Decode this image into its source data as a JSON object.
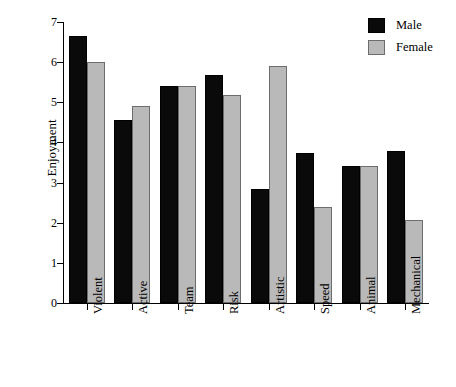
{
  "chart_data": {
    "type": "bar",
    "title": "",
    "subtitle": "",
    "xlabel": "",
    "ylabel": "Enjoyment",
    "categories": [
      "Violent",
      "Active",
      "Team",
      "Risk",
      "Artistic",
      "Speed",
      "Animal",
      "Mechanical"
    ],
    "series": [
      {
        "name": "Male",
        "color": "#0a0a0a",
        "values": [
          6.65,
          4.55,
          5.4,
          5.67,
          2.85,
          3.73,
          3.42,
          3.78
        ]
      },
      {
        "name": "Female",
        "color": "#b9b9b9",
        "values": [
          6.0,
          4.92,
          5.4,
          5.17,
          5.9,
          2.4,
          3.42,
          2.08
        ]
      }
    ],
    "ylim": [
      0,
      7
    ],
    "ytick_labels": [
      "0",
      "1",
      "2",
      "3",
      "4",
      "5",
      "6",
      "7"
    ],
    "ytick_values": [
      0,
      1,
      2,
      3,
      4,
      5,
      6,
      7
    ],
    "grid": false,
    "legend_position": "top-right",
    "legend_entries": [
      {
        "label": "Male",
        "color": "#0a0a0a"
      },
      {
        "label": "Female",
        "color": "#b9b9b9"
      }
    ]
  }
}
